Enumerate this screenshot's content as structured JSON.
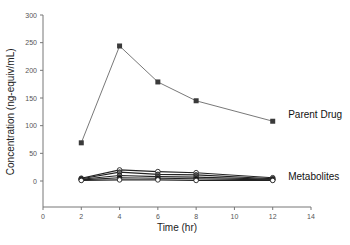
{
  "chart_data": {
    "type": "line",
    "title": "",
    "xlabel": "Time (hr)",
    "ylabel": "Concentration (ng-equiv/mL)",
    "xlim": [
      0,
      14
    ],
    "ylim": [
      -50,
      300
    ],
    "xticks": [
      0,
      2,
      4,
      6,
      8,
      10,
      12,
      14
    ],
    "yticks": [
      0,
      50,
      100,
      150,
      200,
      250,
      300
    ],
    "grid": false,
    "legend": "none (inline annotations)",
    "x": [
      2,
      4,
      6,
      8,
      12
    ],
    "series": [
      {
        "name": "Parent Drug",
        "marker": "square",
        "color": "#444444",
        "values": [
          69,
          244,
          179,
          145,
          108
        ]
      },
      {
        "name": "Metabolite 1",
        "marker": "circle-open",
        "color": "#222222",
        "values": [
          5,
          20,
          17,
          15,
          6
        ]
      },
      {
        "name": "Metabolite 2",
        "marker": "circle",
        "color": "#222222",
        "values": [
          4,
          16,
          12,
          11,
          4
        ]
      },
      {
        "name": "Metabolite 3",
        "marker": "circle",
        "color": "#222222",
        "values": [
          3,
          10,
          8,
          7,
          3
        ]
      },
      {
        "name": "Metabolite 4",
        "marker": "circle-filled",
        "color": "#111111",
        "values": [
          2,
          6,
          5,
          4,
          2
        ]
      },
      {
        "name": "Metabolite 5",
        "marker": "circle-open",
        "color": "#333333",
        "values": [
          1,
          2,
          2,
          1,
          1
        ]
      }
    ],
    "annotations": [
      {
        "text": "Parent Drug",
        "x": 12.6,
        "y": 120
      },
      {
        "text": "Metabolites",
        "x": 12.6,
        "y": 7
      }
    ]
  }
}
